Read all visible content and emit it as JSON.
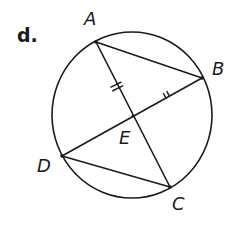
{
  "problem": {
    "label": "d."
  },
  "points": {
    "A": {
      "label": "A",
      "x": 96,
      "y": 42
    },
    "B": {
      "label": "B",
      "x": 202,
      "y": 78
    },
    "C": {
      "label": "C",
      "x": 170,
      "y": 187
    },
    "D": {
      "label": "D",
      "x": 62,
      "y": 156
    },
    "E": {
      "label": "E",
      "x": 133,
      "y": 116
    }
  },
  "circle": {
    "cx": 132,
    "cy": 115,
    "rx": 80,
    "ry": 83
  },
  "segments": [
    {
      "from": "A",
      "to": "C"
    },
    {
      "from": "B",
      "to": "D"
    },
    {
      "from": "A",
      "to": "B"
    },
    {
      "from": "D",
      "to": "C"
    }
  ],
  "congruence_marks": [
    {
      "segment": "AE",
      "ticks": 2
    },
    {
      "segment": "EB",
      "ticks": 2
    }
  ],
  "colors": {
    "stroke": "#1a1a1a",
    "background": "#ffffff"
  }
}
